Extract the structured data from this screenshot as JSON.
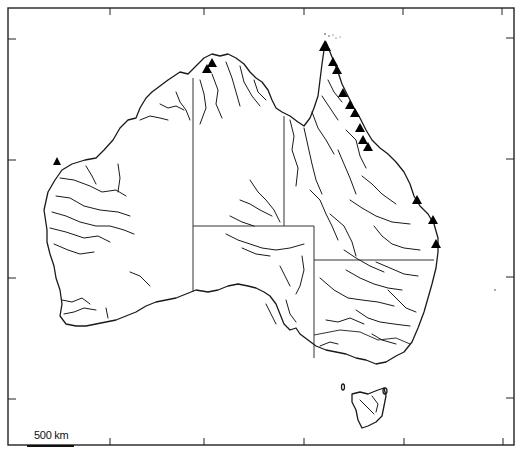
{
  "map": {
    "subject": "Australia",
    "features": [
      "coastline",
      "state borders",
      "rivers",
      "site markers"
    ],
    "scale_bar": {
      "label": "500 km",
      "length_px": 47
    },
    "markers": {
      "symbol": "filled-triangle",
      "color": "#000000",
      "points": [
        {
          "x": 57,
          "y": 162
        },
        {
          "x": 207,
          "y": 70
        },
        {
          "x": 212,
          "y": 64
        },
        {
          "x": 325,
          "y": 46
        },
        {
          "x": 333,
          "y": 62
        },
        {
          "x": 337,
          "y": 70
        },
        {
          "x": 343,
          "y": 93
        },
        {
          "x": 350,
          "y": 105
        },
        {
          "x": 355,
          "y": 113
        },
        {
          "x": 360,
          "y": 128
        },
        {
          "x": 363,
          "y": 140
        },
        {
          "x": 368,
          "y": 147
        },
        {
          "x": 417,
          "y": 200
        },
        {
          "x": 433,
          "y": 220
        },
        {
          "x": 436,
          "y": 244
        }
      ]
    },
    "frame": {
      "bottom_ticks_x": [
        110,
        204,
        304,
        404,
        503
      ],
      "left_ticks_y": [
        39,
        160,
        278,
        399
      ],
      "right_ticks_y": [
        38,
        159,
        277,
        398
      ]
    },
    "colors": {
      "background": "#ffffff",
      "lines": "#1a1a1a"
    }
  }
}
